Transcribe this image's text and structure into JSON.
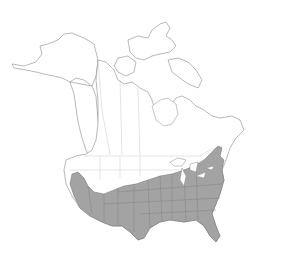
{
  "map": {
    "title": "",
    "region": "North America",
    "legend": [],
    "colors": {
      "background": "#ffffff",
      "land": "#ffffff",
      "coastline": "#8a8a8a",
      "political_borders": "#c8c8c8",
      "range_fill": "#a3a3a3",
      "range_outline": "#6e6e6e"
    },
    "shaded_area_description": "Southern United States: from California east across the southwest, south-central and southeastern states to the Atlantic coast, north through the mid-Atlantic to New England, including Florida"
  }
}
